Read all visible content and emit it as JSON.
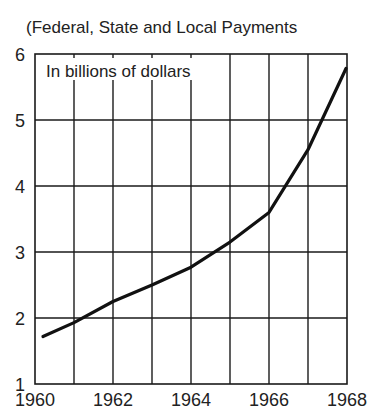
{
  "title_cropped": "CHILD WELFARE",
  "subtitle": "(Federal, State and Local Payments",
  "chart_data": {
    "type": "line",
    "title": "(Federal, State and Local Payments",
    "annotation": "In billions of dollars",
    "xlabel": "",
    "ylabel": "In billions of dollars",
    "x": [
      1960,
      1961,
      1962,
      1963,
      1964,
      1965,
      1966,
      1967,
      1968
    ],
    "series": [
      {
        "name": "Payments",
        "values": [
          1.72,
          1.93,
          2.25,
          2.5,
          2.77,
          3.15,
          3.6,
          4.55,
          5.78
        ]
      }
    ],
    "xlim": [
      1960,
      1968
    ],
    "ylim": [
      1,
      6
    ],
    "yticks": [
      1,
      2,
      3,
      4,
      5,
      6
    ],
    "xtick_labels": [
      "1960",
      "1962",
      "1964",
      "1966",
      "1968"
    ],
    "ytick_labels": [
      "1",
      "2",
      "3",
      "4",
      "5",
      "6"
    ],
    "grid": true,
    "legend": "none"
  }
}
